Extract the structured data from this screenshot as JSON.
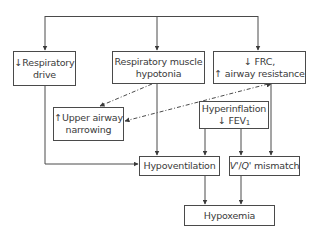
{
  "diagram": {
    "title": "",
    "nodes": {
      "respiratory_drive": {
        "line1": "↓Respiratory",
        "line2": "drive"
      },
      "muscle_hypotonia": {
        "line1": "Respiratory muscle",
        "line2": "hypotonia"
      },
      "frc": {
        "line1": "↓ FRC,",
        "line2": "↑ airway resistance"
      },
      "upper_airway": {
        "line1": "↑Upper airway",
        "line2": "narrowing"
      },
      "hyperinflation": {
        "line1": "Hyperinflation",
        "line2": "↓ FEV",
        "line2_sub": "1"
      },
      "hypoventilation": {
        "line1": "Hypoventilation"
      },
      "vq_mismatch": {
        "v": "V'",
        "slash": "/",
        "q": "Q'",
        "rest": " mismatch"
      },
      "hypoxemia": {
        "line1": "Hypoxemia"
      }
    },
    "edges": [
      {
        "from": "top_bus",
        "to": "respiratory_drive",
        "style": "solid"
      },
      {
        "from": "top_bus",
        "to": "muscle_hypotonia",
        "style": "solid"
      },
      {
        "from": "top_bus",
        "to": "frc",
        "style": "solid"
      },
      {
        "from": "muscle_hypotonia",
        "to": "upper_airway",
        "style": "dashed"
      },
      {
        "from": "frc",
        "to": "upper_airway",
        "style": "dashed",
        "bidirectional": true
      },
      {
        "from": "respiratory_drive",
        "to": "hypoventilation",
        "style": "solid"
      },
      {
        "from": "muscle_hypotonia",
        "to": "hypoventilation",
        "style": "solid"
      },
      {
        "from": "hyperinflation",
        "to": "hypoventilation",
        "style": "solid"
      },
      {
        "from": "hyperinflation",
        "to": "vq_mismatch",
        "style": "solid"
      },
      {
        "from": "frc",
        "to": "vq_mismatch",
        "style": "solid"
      },
      {
        "from": "hypoventilation",
        "to": "hypoxemia",
        "style": "solid"
      },
      {
        "from": "vq_mismatch",
        "to": "hypoxemia",
        "style": "solid"
      }
    ],
    "colors": {
      "line": "#4a4a4a",
      "text": "#3a3a3a",
      "background": "#ffffff"
    }
  }
}
